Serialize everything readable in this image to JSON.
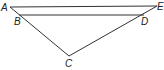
{
  "diagram": {
    "type": "triangle-with-parallel-segment",
    "points": {
      "A": {
        "label": "A",
        "x": 10,
        "y": 7
      },
      "E": {
        "label": "E",
        "x": 157,
        "y": 6
      },
      "B": {
        "label": "B",
        "x": 19,
        "y": 15
      },
      "D": {
        "label": "D",
        "x": 144,
        "y": 15
      },
      "C": {
        "label": "C",
        "x": 69,
        "y": 56
      }
    },
    "segments": [
      [
        "A",
        "E"
      ],
      [
        "A",
        "C"
      ],
      [
        "C",
        "E"
      ],
      [
        "B",
        "D"
      ]
    ],
    "line_color": "#333333"
  }
}
